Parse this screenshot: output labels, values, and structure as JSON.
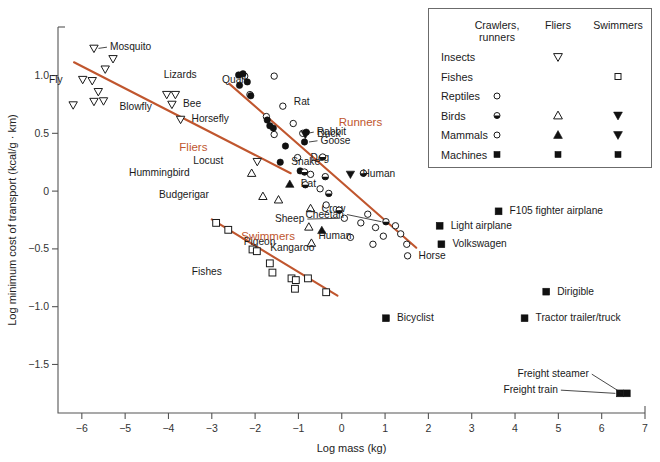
{
  "chart_data": {
    "type": "scatter",
    "title": "",
    "xlabel": "Log mass (kg)",
    "ylabel": "Log minimum cost of transport (kcal/g · km)",
    "xlim": [
      -6.55,
      7.0
    ],
    "ylim": [
      -1.92,
      1.42
    ],
    "xticks": [
      -6,
      -5,
      -4,
      -3,
      -2,
      -1,
      0,
      1,
      2,
      3,
      4,
      5,
      6,
      7
    ],
    "xticklabels": [
      "−6",
      "−5",
      "−4",
      "−3",
      "−2",
      "−1",
      "0",
      "1",
      "2",
      "3",
      "4",
      "5",
      "6",
      "7"
    ],
    "yticks": [
      1.0,
      0.5,
      0,
      -0.5,
      -1.0,
      -1.5
    ],
    "yticklabels": [
      "1.0",
      "0.5",
      "0",
      "−0.5",
      "−1.0",
      "−1.5"
    ],
    "grid": false,
    "legend_position": "top-right",
    "accent_color": "#C0562E",
    "marker_color": "#111111",
    "group_labels": [
      {
        "text": "Fliers",
        "x": -3.75,
        "y": 0.345
      },
      {
        "text": "Runners",
        "x": -0.07,
        "y": 0.565
      },
      {
        "text": "Swimmers",
        "x": -2.32,
        "y": -0.425
      }
    ],
    "fit_lines": [
      {
        "name": "fliers-line",
        "x1": -6.18,
        "y1": 1.115,
        "x2": -1.18,
        "y2": 0.155
      },
      {
        "name": "runners-line",
        "x1": -2.6,
        "y1": 0.93,
        "x2": 1.72,
        "y2": -0.49
      },
      {
        "name": "swimmers-line",
        "x1": -3.0,
        "y1": -0.245,
        "x2": -0.1,
        "y2": -0.905
      }
    ],
    "series": [
      {
        "name": "Insects fliers",
        "marker": "triangle-down-open",
        "points": [
          {
            "x": -5.72,
            "y": 1.235,
            "label": "Mosquito",
            "label_dx": 16,
            "label_dy": 2,
            "leader": true
          },
          {
            "x": -5.28,
            "y": 1.145,
            "label": "",
            "label_dx": 0,
            "label_dy": 0
          },
          {
            "x": -5.46,
            "y": 1.055,
            "label": "",
            "label_dx": 0,
            "label_dy": 0
          },
          {
            "x": -5.98,
            "y": 0.965,
            "label": "Fly",
            "label_dx": -20,
            "label_dy": 3,
            "leader": false
          },
          {
            "x": -5.76,
            "y": 0.955,
            "label": "",
            "label_dx": 0,
            "label_dy": 0
          },
          {
            "x": -5.62,
            "y": 0.86,
            "label": "",
            "label_dx": 0,
            "label_dy": 0
          },
          {
            "x": -5.72,
            "y": 0.775,
            "label": "",
            "label_dx": 0,
            "label_dy": 0
          },
          {
            "x": -5.5,
            "y": 0.78,
            "label": "Blowfly",
            "label_dx": 16,
            "label_dy": 9,
            "leader": false
          },
          {
            "x": -6.2,
            "y": 0.745,
            "label": "",
            "label_dx": 0,
            "label_dy": 0
          },
          {
            "x": -4.04,
            "y": 0.835,
            "label": "",
            "label_dx": 0,
            "label_dy": 0
          },
          {
            "x": -3.84,
            "y": 0.835,
            "label": "",
            "label_dx": 0,
            "label_dy": 0
          },
          {
            "x": -3.92,
            "y": 0.75,
            "label": "Bee",
            "label_dx": 11,
            "label_dy": 3,
            "leader": false
          },
          {
            "x": -3.72,
            "y": 0.62,
            "label": "Horsefly",
            "label_dx": 11,
            "label_dy": 3,
            "leader": false
          },
          {
            "x": -1.95,
            "y": 0.255,
            "label": "Locust",
            "label_dx": -34,
            "label_dy": 2,
            "leader": false
          }
        ]
      },
      {
        "name": "Birds fliers",
        "marker": "triangle-up-open",
        "points": [
          {
            "x": -2.08,
            "y": 0.155,
            "label": "Hummingbird",
            "label_dx": -62,
            "label_dy": 3,
            "leader": false
          },
          {
            "x": -1.82,
            "y": -0.045,
            "label": "Budgerigar",
            "label_dx": -54,
            "label_dy": 2,
            "leader": false
          },
          {
            "x": -1.46,
            "y": -0.075,
            "label": "",
            "label_dx": 0,
            "label_dy": 0
          },
          {
            "x": -0.72,
            "y": -0.15,
            "label": "Crow",
            "label_dx": 11,
            "label_dy": 4,
            "leader": false
          },
          {
            "x": -0.76,
            "y": -0.31,
            "label": "",
            "label_dx": 0,
            "label_dy": 0
          },
          {
            "x": -0.7,
            "y": -0.45,
            "label": "Pigeon",
            "label_dx": -36,
            "label_dy": 2,
            "leader": false
          }
        ]
      },
      {
        "name": "Mammals fliers",
        "marker": "triangle-up-filled",
        "points": [
          {
            "x": -1.2,
            "y": 0.06,
            "label": "Bat",
            "label_dx": 11,
            "label_dy": 3,
            "leader": false
          },
          {
            "x": -0.46,
            "y": -0.34,
            "label": "",
            "label_dx": 0,
            "label_dy": 0
          }
        ]
      },
      {
        "name": "Reptiles crawlers",
        "marker": "circle-open",
        "points": [
          {
            "x": -2.24,
            "y": 0.995,
            "label": "",
            "label_dx": 0,
            "label_dy": 0
          },
          {
            "x": -1.56,
            "y": 0.995,
            "label": "",
            "label_dx": 0,
            "label_dy": 0
          },
          {
            "x": -2.12,
            "y": 0.835,
            "label": "Quail",
            "label_dx": -4,
            "label_dy": -12
          },
          {
            "x": -1.74,
            "y": 0.645,
            "label": "",
            "label_dx": 0,
            "label_dy": 0
          },
          {
            "x": -1.36,
            "y": 0.735,
            "label": "Rat",
            "label_dx": 11,
            "label_dy": -1,
            "leader": false
          },
          {
            "x": -1.56,
            "y": 0.49,
            "label": "",
            "label_dx": 0,
            "label_dy": 0
          },
          {
            "x": -1.12,
            "y": 0.585,
            "label": "",
            "label_dx": 0,
            "label_dy": 0
          },
          {
            "x": -0.9,
            "y": 0.5,
            "label": "Rabbit",
            "label_dx": 14,
            "label_dy": 2,
            "leader": true
          },
          {
            "x": -1.02,
            "y": 0.29,
            "label": "Dog",
            "label_dx": 13,
            "label_dy": 3,
            "leader": false
          },
          {
            "x": -0.72,
            "y": 0.145,
            "label": "",
            "label_dx": 0,
            "label_dy": 0
          },
          {
            "x": -0.5,
            "y": 0.02,
            "label": "",
            "label_dx": 0,
            "label_dy": 0
          },
          {
            "x": -0.36,
            "y": -0.12,
            "label": "",
            "label_dx": 0,
            "label_dy": 0
          },
          {
            "x": 0.06,
            "y": -0.235,
            "label": "Sheep",
            "label_dx": -40,
            "label_dy": 4,
            "leader": true
          },
          {
            "x": 0.44,
            "y": -0.275,
            "label": "",
            "label_dx": 0,
            "label_dy": 0
          },
          {
            "x": 0.6,
            "y": -0.2,
            "label": "",
            "label_dx": 0,
            "label_dy": 0
          },
          {
            "x": 0.78,
            "y": -0.315,
            "label": "",
            "label_dx": 0,
            "label_dy": 0
          },
          {
            "x": 0.2,
            "y": -0.4,
            "label": "Kangaroo",
            "label_dx": -36,
            "label_dy": 14,
            "leader": false
          },
          {
            "x": 0.96,
            "y": -0.39,
            "label": "Human",
            "label_dx": -32,
            "label_dy": 3,
            "leader": false
          },
          {
            "x": 1.24,
            "y": -0.3,
            "label": "",
            "label_dx": 0,
            "label_dy": 0
          },
          {
            "x": 1.36,
            "y": -0.37,
            "label": "",
            "label_dx": 0,
            "label_dy": 0
          },
          {
            "x": 1.5,
            "y": -0.46,
            "label": "",
            "label_dx": 0,
            "label_dy": 0
          },
          {
            "x": 1.52,
            "y": -0.56,
            "label": "Horse",
            "label_dx": 11,
            "label_dy": 3,
            "leader": false
          },
          {
            "x": 0.72,
            "y": -0.46,
            "label": "",
            "label_dx": 0,
            "label_dy": 0
          }
        ]
      },
      {
        "name": "Mammals crawlers filled",
        "marker": "circle-filled",
        "points": [
          {
            "x": -2.38,
            "y": 1.005,
            "label": "Lizards",
            "label_dx": -42,
            "label_dy": 3,
            "leader": false
          },
          {
            "x": -2.28,
            "y": 1.015,
            "label": "",
            "label_dx": 0,
            "label_dy": 0
          },
          {
            "x": -2.36,
            "y": 0.915,
            "label": "",
            "label_dx": 0,
            "label_dy": 0
          },
          {
            "x": -2.18,
            "y": 0.945,
            "label": "",
            "label_dx": 0,
            "label_dy": 0
          },
          {
            "x": -2.1,
            "y": 0.825,
            "label": "",
            "label_dx": 0,
            "label_dy": 0
          },
          {
            "x": -1.72,
            "y": 0.615,
            "label": "",
            "label_dx": 0,
            "label_dy": 0
          },
          {
            "x": -1.66,
            "y": 0.565,
            "label": "",
            "label_dx": 0,
            "label_dy": 0
          },
          {
            "x": -1.58,
            "y": 0.545,
            "label": "",
            "label_dx": 0,
            "label_dy": 0
          },
          {
            "x": -1.3,
            "y": 0.39,
            "label": "",
            "label_dx": 0,
            "label_dy": 0
          },
          {
            "x": -0.82,
            "y": 0.51,
            "label": "",
            "label_dx": 0,
            "label_dy": 0
          },
          {
            "x": -0.86,
            "y": 0.425,
            "label": "Goose",
            "label_dx": 16,
            "label_dy": 2,
            "leader": true
          },
          {
            "x": -1.42,
            "y": 0.25,
            "label": "Snake",
            "label_dx": 11,
            "label_dy": 3,
            "leader": false
          },
          {
            "x": -0.96,
            "y": 0.175,
            "label": "",
            "label_dx": 0,
            "label_dy": 0
          }
        ]
      },
      {
        "name": "Birds crawlers half",
        "marker": "circle-halffill",
        "points": [
          {
            "x": -0.86,
            "y": 0.165,
            "label": "",
            "label_dx": 0,
            "label_dy": 0
          },
          {
            "x": -0.84,
            "y": 0.055,
            "label": "",
            "label_dx": 0,
            "label_dy": 0
          },
          {
            "x": -0.44,
            "y": 0.295,
            "label": "",
            "label_dx": 0,
            "label_dy": 0
          },
          {
            "x": -0.38,
            "y": 0.125,
            "label": "",
            "label_dx": 0,
            "label_dy": 0
          },
          {
            "x": -0.3,
            "y": -0.02,
            "label": "",
            "label_dx": 0,
            "label_dy": 0
          },
          {
            "x": -0.06,
            "y": -0.165,
            "label": "",
            "label_dx": 0,
            "label_dy": 0
          },
          {
            "x": 0.5,
            "y": 0.155,
            "label": "",
            "label_dx": 0,
            "label_dy": 0
          },
          {
            "x": 1.02,
            "y": -0.265,
            "label": "Cheetah",
            "label_dx": -42,
            "label_dy": -4,
            "leader": true
          }
        ]
      },
      {
        "name": "Mammals swimmers",
        "marker": "triangle-down-filled",
        "points": [
          {
            "x": -0.84,
            "y": 0.49,
            "label": "Duck",
            "label_dx": 12,
            "label_dy": 3,
            "leader": false
          },
          {
            "x": 0.2,
            "y": 0.145,
            "label": "Human",
            "label_dx": 12,
            "label_dy": 3,
            "leader": false
          }
        ]
      },
      {
        "name": "Fishes swimmers",
        "marker": "square-open",
        "points": [
          {
            "x": -2.9,
            "y": -0.275,
            "label": "",
            "label_dx": 0,
            "label_dy": 0
          },
          {
            "x": -2.62,
            "y": -0.335,
            "label": "",
            "label_dx": 0,
            "label_dy": 0
          },
          {
            "x": -2.06,
            "y": -0.505,
            "label": "",
            "label_dx": 0,
            "label_dy": 0
          },
          {
            "x": -1.96,
            "y": -0.52,
            "label": "",
            "label_dx": 0,
            "label_dy": 0
          },
          {
            "x": -1.66,
            "y": -0.625,
            "label": "Fishes",
            "label_dx": -48,
            "label_dy": 12,
            "leader": false
          },
          {
            "x": -1.6,
            "y": -0.705,
            "label": "",
            "label_dx": 0,
            "label_dy": 0
          },
          {
            "x": -1.16,
            "y": -0.755,
            "label": "",
            "label_dx": 0,
            "label_dy": 0
          },
          {
            "x": -1.06,
            "y": -0.77,
            "label": "",
            "label_dx": 0,
            "label_dy": 0
          },
          {
            "x": -1.08,
            "y": -0.845,
            "label": "",
            "label_dx": 0,
            "label_dy": 0
          },
          {
            "x": -0.78,
            "y": -0.755,
            "label": "",
            "label_dx": 0,
            "label_dy": 0
          },
          {
            "x": -0.36,
            "y": -0.875,
            "label": "",
            "label_dx": 0,
            "label_dy": 0
          }
        ]
      },
      {
        "name": "Machines",
        "marker": "square-filled",
        "points": [
          {
            "x": 3.62,
            "y": -0.175,
            "label": "F105 fighter airplane",
            "label_dx": 11,
            "label_dy": 3,
            "leader": false
          },
          {
            "x": 2.26,
            "y": -0.3,
            "label": "Light airplane",
            "label_dx": 11,
            "label_dy": 3,
            "leader": false
          },
          {
            "x": 2.3,
            "y": -0.46,
            "label": "Volkswagen",
            "label_dx": 11,
            "label_dy": 3,
            "leader": false
          },
          {
            "x": 4.72,
            "y": -0.87,
            "label": "Dirigible",
            "label_dx": 11,
            "label_dy": 3,
            "leader": false
          },
          {
            "x": 1.02,
            "y": -1.1,
            "label": "Bicyclist",
            "label_dx": 11,
            "label_dy": 3,
            "leader": false
          },
          {
            "x": 4.22,
            "y": -1.1,
            "label": "Tractor trailer/truck",
            "label_dx": 11,
            "label_dy": 3,
            "leader": false
          },
          {
            "x": 6.42,
            "y": -1.75,
            "label": "Freight train",
            "label_dx": -62,
            "label_dy": 0,
            "leader": true
          },
          {
            "x": 6.58,
            "y": -1.75,
            "label": "Freight steamer",
            "label_dx": -38,
            "label_dy": -16,
            "leader": true
          }
        ]
      }
    ]
  },
  "legend": {
    "columns": [
      "Crawlers,\nrunners",
      "Fliers",
      "Swimmers"
    ],
    "col_headers": [
      {
        "line1": "Crawlers,",
        "line2": "runners"
      },
      {
        "line1": "Fliers",
        "line2": ""
      },
      {
        "line1": "Swimmers",
        "line2": ""
      }
    ],
    "rows": [
      {
        "label": "Insects",
        "crawlers": "",
        "fliers": "triangle-down-open",
        "swimmers": ""
      },
      {
        "label": "Fishes",
        "crawlers": "",
        "fliers": "",
        "swimmers": "square-open"
      },
      {
        "label": "Reptiles",
        "crawlers": "circle-open",
        "fliers": "",
        "swimmers": ""
      },
      {
        "label": "Birds",
        "crawlers": "circle-halffill",
        "fliers": "triangle-up-open",
        "swimmers": "triangle-down-filled"
      },
      {
        "label": "Mammals",
        "crawlers": "circle-open",
        "fliers": "triangle-up-filled",
        "swimmers": "triangle-down-filled"
      },
      {
        "label": "Machines",
        "crawlers": "square-filled",
        "fliers": "square-filled",
        "swimmers": "square-filled"
      }
    ]
  }
}
